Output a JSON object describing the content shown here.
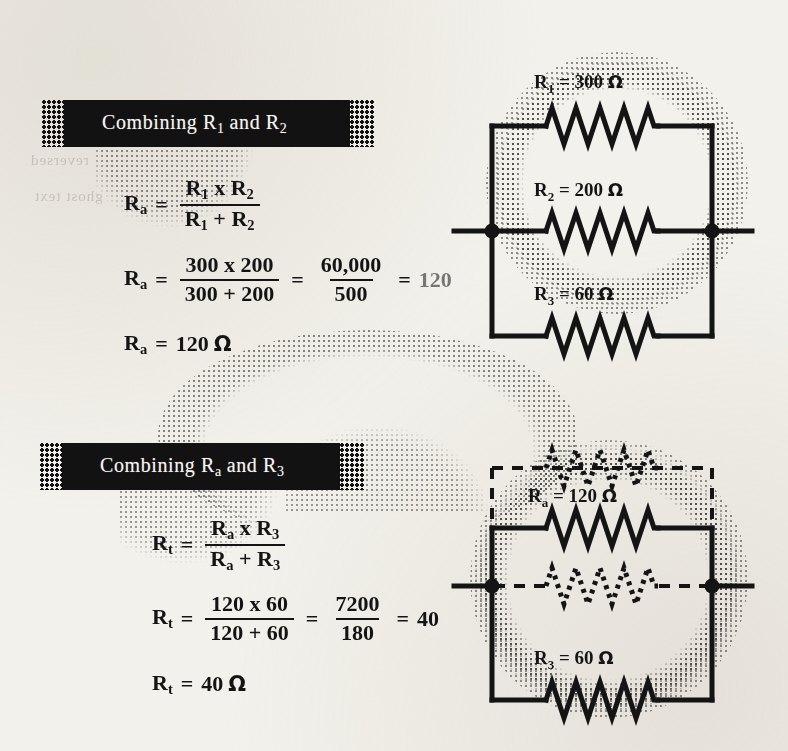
{
  "page": {
    "background_color": "#f3f1ec",
    "ink_color": "#141414",
    "banner_color": "#121212",
    "banner_text_color": "#f6f4ef"
  },
  "bleedthrough": [
    {
      "text": "reversed"
    },
    {
      "text": "ghost text"
    }
  ],
  "sections": [
    {
      "id": "section-1",
      "banner": {
        "prefix": "Combining R",
        "sub1": "1",
        "middle": " and R",
        "sub2": "2"
      },
      "equations": [
        {
          "id": "eq-ra-formula",
          "lhs": "R",
          "lhs_sub": "a",
          "eq": "=",
          "num": "R₁ x R₂",
          "num_parts": [
            {
              "base": "R",
              "sub": "1"
            },
            {
              "base": " x "
            },
            {
              "base": "R",
              "sub": "2"
            }
          ],
          "den_parts": [
            {
              "base": "R",
              "sub": "1"
            },
            {
              "base": " + "
            },
            {
              "base": "R",
              "sub": "2"
            }
          ]
        },
        {
          "id": "eq-ra-numeric",
          "lhs": "R",
          "lhs_sub": "a",
          "eq": "=",
          "frac1_num": "300 x 200",
          "frac1_den": "300 + 200",
          "eq2": "=",
          "frac2_num": "60,000",
          "frac2_den": "500",
          "eq3": "=",
          "result": "120"
        },
        {
          "id": "eq-ra-result",
          "lhs": "R",
          "lhs_sub": "a",
          "eq": "=",
          "value": "120",
          "unit": "Ω"
        }
      ],
      "circuit": {
        "id": "circuit-parallel-three",
        "branches": [
          {
            "id": "branch-r1",
            "label_base": "R",
            "label_sub": "1",
            "eq": "=",
            "value": "300",
            "unit": "Ω",
            "style": "solid"
          },
          {
            "id": "branch-r2",
            "label_base": "R",
            "label_sub": "2",
            "eq": "=",
            "value": "200",
            "unit": "Ω",
            "style": "solid"
          },
          {
            "id": "branch-r3",
            "label_base": "R",
            "label_sub": "3",
            "eq": "=",
            "value": "60",
            "unit": "Ω",
            "style": "solid"
          }
        ],
        "terminals": 2
      }
    },
    {
      "id": "section-2",
      "banner": {
        "prefix": "Combining R",
        "sub1": "a",
        "middle": " and R",
        "sub2": "3"
      },
      "equations": [
        {
          "id": "eq-rt-formula",
          "lhs": "R",
          "lhs_sub": "t",
          "eq": "=",
          "num_parts": [
            {
              "base": "R",
              "sub": "a"
            },
            {
              "base": " x "
            },
            {
              "base": "R",
              "sub": "3"
            }
          ],
          "den_parts": [
            {
              "base": "R",
              "sub": "a"
            },
            {
              "base": " + "
            },
            {
              "base": "R",
              "sub": "3"
            }
          ]
        },
        {
          "id": "eq-rt-numeric",
          "lhs": "R",
          "lhs_sub": "t",
          "eq": "=",
          "frac1_num": "120 x 60",
          "frac1_den": "120 + 60",
          "eq2": "=",
          "frac2_num": "7200",
          "frac2_den": "180",
          "eq3": "=",
          "result": "40"
        },
        {
          "id": "eq-rt-result",
          "lhs": "R",
          "lhs_sub": "t",
          "eq": "=",
          "value": "40",
          "unit": "Ω"
        }
      ],
      "circuit": {
        "id": "circuit-parallel-reduced",
        "branches": [
          {
            "id": "branch-ghost-top",
            "label_base": "",
            "label_sub": "",
            "eq": "",
            "value": "",
            "unit": "",
            "style": "dashed"
          },
          {
            "id": "branch-ra",
            "label_base": "R",
            "label_sub": "a",
            "eq": "=",
            "value": "120",
            "unit": "Ω",
            "style": "solid"
          },
          {
            "id": "branch-ghost-mid",
            "label_base": "",
            "label_sub": "",
            "eq": "",
            "value": "",
            "unit": "",
            "style": "dashed"
          },
          {
            "id": "branch-r3b",
            "label_base": "R",
            "label_sub": "3",
            "eq": "=",
            "value": "60",
            "unit": "Ω",
            "style": "solid"
          }
        ],
        "terminals": 2
      }
    }
  ]
}
